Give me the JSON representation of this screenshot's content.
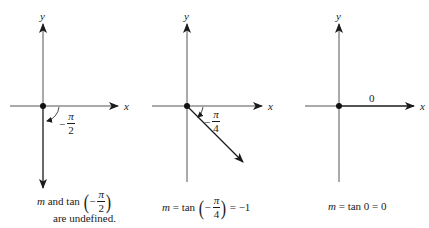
{
  "panels": [
    {
      "id": "vertical",
      "axis_labels": {
        "x": "x",
        "y": "y"
      },
      "angle_label": {
        "sign": "−",
        "numerator": "π",
        "denominator": "2"
      },
      "caption": {
        "var": "m",
        "text1": " and tan ",
        "paren_open": "(",
        "frac": {
          "sign": "−",
          "numerator": "π",
          "denominator": "2"
        },
        "paren_close": ")",
        "line2": "are undefined."
      }
    },
    {
      "id": "diagonal",
      "axis_labels": {
        "x": "x",
        "y": "y"
      },
      "angle_label": {
        "sign": "−",
        "numerator": "π",
        "denominator": "4"
      },
      "caption": {
        "var": "m",
        "text1": " = tan ",
        "paren_open": "(",
        "frac": {
          "sign": "−",
          "numerator": "π",
          "denominator": "4"
        },
        "paren_close": ")",
        "text2": " = −1"
      }
    },
    {
      "id": "horizontal",
      "axis_labels": {
        "x": "x",
        "y": "y"
      },
      "angle_label": "0",
      "caption": {
        "var": "m",
        "text1": " = tan 0 = 0"
      }
    }
  ],
  "colors": {
    "ink": "#1a1a1a",
    "axis": "#555555"
  }
}
